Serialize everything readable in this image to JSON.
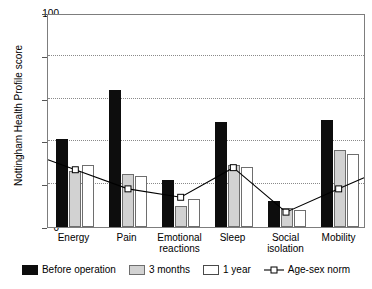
{
  "chart_data": {
    "type": "bar",
    "title": "",
    "subtitle": "",
    "xlabel": "",
    "ylabel": "Nottingham Health Profile score",
    "ylim": [
      0,
      100
    ],
    "yticks": [
      0,
      20,
      40,
      60,
      80,
      100
    ],
    "grid": "horizontal dotted gridlines at 20, 40, 60, 80",
    "legend_position": "below plot",
    "categories": [
      "Energy",
      "Pain",
      "Emotional\nreactions",
      "Sleep",
      "Social\nisolation",
      "Mobility"
    ],
    "series": [
      {
        "name": "Before operation",
        "type": "bar",
        "color": "#0d0d0d",
        "values": [
          41,
          64,
          22,
          49,
          12,
          50
        ]
      },
      {
        "name": "3 months",
        "type": "bar",
        "color": "#d2d2d2",
        "values": [
          26,
          25,
          10,
          29,
          9,
          36
        ]
      },
      {
        "name": "1 year",
        "type": "bar",
        "color": "#ffffff",
        "values": [
          29,
          24,
          13,
          28,
          8,
          34
        ]
      },
      {
        "name": "Age-sex norm",
        "type": "line",
        "color": "#000000",
        "marker": "open-square",
        "values": [
          27,
          18,
          14,
          28,
          7,
          18
        ]
      }
    ]
  },
  "axis": {
    "y_title": "Nottingham Health Profile score",
    "y_tick_labels": [
      "0",
      "20",
      "40",
      "60",
      "80",
      "100"
    ]
  },
  "legend": {
    "items": [
      {
        "label": "Before operation",
        "swatch": "black-square-swatch"
      },
      {
        "label": "3 months",
        "swatch": "gray-square-swatch"
      },
      {
        "label": "1 year",
        "swatch": "white-square-swatch"
      },
      {
        "label": "Age-sex norm",
        "swatch": "line-open-square-marker"
      }
    ]
  }
}
